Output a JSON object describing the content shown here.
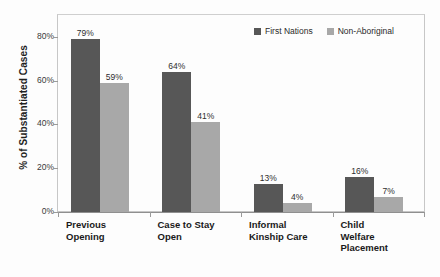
{
  "title_remnant": "",
  "chart_data": {
    "type": "bar",
    "title": "",
    "xlabel": "",
    "ylabel": "% of Substantiated Cases",
    "ylim": [
      0,
      90
    ],
    "ytick_values": [
      0,
      20,
      40,
      60,
      80
    ],
    "ytick_labels": [
      "0%",
      "20%",
      "40%",
      "60%",
      "80%"
    ],
    "grid": false,
    "legend_position": "top-right",
    "categories": [
      "Previous\nOpening",
      "Case to Stay\nOpen",
      "Informal\nKinship Care",
      "Child\nWelfare\n Placement"
    ],
    "series": [
      {
        "name": "First Nations",
        "color": "#575757",
        "values": [
          79,
          64,
          13,
          16
        ],
        "labels": [
          "79%",
          "64%",
          "13%",
          "16%"
        ]
      },
      {
        "name": "Non-Aboriginal",
        "color": "#a8a8a8",
        "values": [
          59,
          41,
          4,
          7
        ],
        "labels": [
          "59%",
          "41%",
          "4%",
          "7%"
        ]
      }
    ]
  },
  "legend": {
    "items": [
      {
        "label": "First Nations",
        "swatch": "dark"
      },
      {
        "label": "Non-Aboriginal",
        "swatch": "light"
      }
    ]
  },
  "axis": {
    "y_title": "% of Substantiated Cases"
  }
}
